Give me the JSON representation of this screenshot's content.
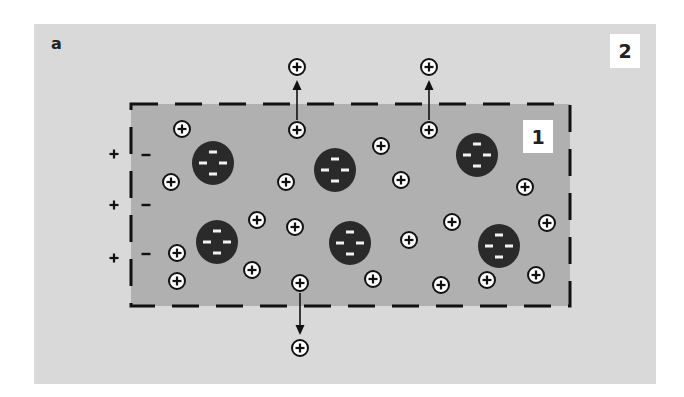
{
  "figure": {
    "panel_label": "a",
    "region_outer_label": "2",
    "region_inner_label": "1",
    "colors": {
      "page_bg": "#ffffff",
      "outer_region": "#d9d9d9",
      "inner_region": "#b0b0b0",
      "boundary": "#111111",
      "particle": "#2a2a2a",
      "particle_charge": "#f2f2f2",
      "ion_fill": "#ffffff",
      "ion_stroke": "#111111",
      "arrow": "#111111"
    },
    "outer_rect": {
      "x": 34,
      "y": 24,
      "w": 622,
      "h": 360
    },
    "inner_rect": {
      "x": 131,
      "y": 104,
      "w": 439,
      "h": 202
    },
    "boundary_dash": "27 17",
    "particles": [
      {
        "cx": 213,
        "cy": 163,
        "rx": 21,
        "ry": 22,
        "charge": "-",
        "count": 4
      },
      {
        "cx": 335,
        "cy": 170,
        "rx": 21,
        "ry": 22,
        "charge": "-",
        "count": 4
      },
      {
        "cx": 477,
        "cy": 155,
        "rx": 21,
        "ry": 22,
        "charge": "-",
        "count": 4
      },
      {
        "cx": 217,
        "cy": 242,
        "rx": 21,
        "ry": 22,
        "charge": "-",
        "count": 4
      },
      {
        "cx": 350,
        "cy": 243,
        "rx": 21,
        "ry": 22,
        "charge": "-",
        "count": 4
      },
      {
        "cx": 499,
        "cy": 246,
        "rx": 21,
        "ry": 22,
        "charge": "-",
        "count": 4
      }
    ],
    "ions_inside": [
      {
        "cx": 182,
        "cy": 129,
        "charge": "+"
      },
      {
        "cx": 297,
        "cy": 130,
        "charge": "+"
      },
      {
        "cx": 429,
        "cy": 130,
        "charge": "+"
      },
      {
        "cx": 381,
        "cy": 146,
        "charge": "+"
      },
      {
        "cx": 171,
        "cy": 182,
        "charge": "+"
      },
      {
        "cx": 286,
        "cy": 182,
        "charge": "+"
      },
      {
        "cx": 401,
        "cy": 180,
        "charge": "+"
      },
      {
        "cx": 525,
        "cy": 187,
        "charge": "+"
      },
      {
        "cx": 257,
        "cy": 220,
        "charge": "+"
      },
      {
        "cx": 295,
        "cy": 227,
        "charge": "+"
      },
      {
        "cx": 452,
        "cy": 222,
        "charge": "+"
      },
      {
        "cx": 547,
        "cy": 223,
        "charge": "+"
      },
      {
        "cx": 409,
        "cy": 240,
        "charge": "+"
      },
      {
        "cx": 177,
        "cy": 253,
        "charge": "+"
      },
      {
        "cx": 252,
        "cy": 270,
        "charge": "+"
      },
      {
        "cx": 177,
        "cy": 281,
        "charge": "+"
      },
      {
        "cx": 300,
        "cy": 283,
        "charge": "+"
      },
      {
        "cx": 373,
        "cy": 279,
        "charge": "+"
      },
      {
        "cx": 441,
        "cy": 285,
        "charge": "+"
      },
      {
        "cx": 487,
        "cy": 280,
        "charge": "+"
      },
      {
        "cx": 536,
        "cy": 275,
        "charge": "+"
      }
    ],
    "ions_escaped": [
      {
        "cx": 297,
        "cy": 67,
        "charge": "+"
      },
      {
        "cx": 429,
        "cy": 67,
        "charge": "+"
      },
      {
        "cx": 300,
        "cy": 348,
        "charge": "+"
      }
    ],
    "arrows": [
      {
        "x": 297,
        "y1": 120,
        "y2": 80,
        "direction": "up"
      },
      {
        "x": 429,
        "y1": 120,
        "y2": 80,
        "direction": "up"
      },
      {
        "x": 300,
        "y1": 293,
        "y2": 335,
        "direction": "down"
      }
    ],
    "surface_charges": {
      "outer_side": [
        {
          "x": 114,
          "y": 154,
          "sign": "+"
        },
        {
          "x": 114,
          "y": 205,
          "sign": "+"
        },
        {
          "x": 114,
          "y": 258,
          "sign": "+"
        }
      ],
      "inner_side": [
        {
          "x": 146,
          "y": 155,
          "sign": "-"
        },
        {
          "x": 146,
          "y": 205,
          "sign": "-"
        },
        {
          "x": 146,
          "y": 254,
          "sign": "-"
        }
      ]
    }
  }
}
